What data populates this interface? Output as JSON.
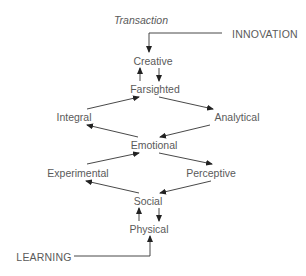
{
  "diagram": {
    "header": "Transaction",
    "entry_top": "INNOVATION",
    "entry_bottom": "LEARNING",
    "nodes": {
      "creative": "Creative",
      "farsighted": "Farsighted",
      "integral": "Integral",
      "analytical": "Analytical",
      "emotional": "Emotional",
      "experimental": "Experimental",
      "perceptive": "Perceptive",
      "social": "Social",
      "physical": "Physical"
    },
    "edges": [
      [
        "INNOVATION",
        "Creative"
      ],
      [
        "Creative",
        "Farsighted"
      ],
      [
        "Farsighted",
        "Creative"
      ],
      [
        "Farsighted",
        "Analytical"
      ],
      [
        "Analytical",
        "Emotional"
      ],
      [
        "Emotional",
        "Integral"
      ],
      [
        "Integral",
        "Farsighted"
      ],
      [
        "Emotional",
        "Perceptive"
      ],
      [
        "Perceptive",
        "Social"
      ],
      [
        "Social",
        "Experimental"
      ],
      [
        "Experimental",
        "Emotional"
      ],
      [
        "Social",
        "Physical"
      ],
      [
        "Physical",
        "Social"
      ],
      [
        "LEARNING",
        "Physical"
      ]
    ],
    "line_color": "#333333",
    "text_color": "#5a5a5a"
  }
}
